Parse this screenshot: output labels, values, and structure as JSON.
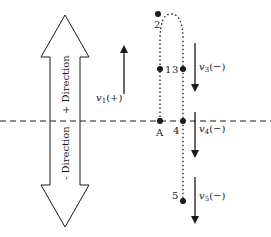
{
  "diagram": {
    "direction_arrow": {
      "positive_label": "+ Direction",
      "negative_label": "- Direction"
    },
    "reference_line_label": "A",
    "points": [
      {
        "id": "A",
        "label": "A"
      },
      {
        "id": "1",
        "label": "1"
      },
      {
        "id": "2",
        "label": "2"
      },
      {
        "id": "3",
        "label": "3"
      },
      {
        "id": "4",
        "label": "4"
      },
      {
        "id": "5",
        "label": "5"
      }
    ],
    "velocities": [
      {
        "symbol": "v",
        "subscript": "1",
        "sign": "(+)",
        "direction": "up"
      },
      {
        "symbol": "v",
        "subscript": "3",
        "sign": "(−)",
        "direction": "down"
      },
      {
        "symbol": "v",
        "subscript": "4",
        "sign": "(−)",
        "direction": "down"
      },
      {
        "symbol": "v",
        "subscript": "5",
        "sign": "(−)",
        "direction": "down"
      }
    ],
    "colors": {
      "stroke": "#1a1a1a",
      "background": "#ffffff"
    }
  }
}
